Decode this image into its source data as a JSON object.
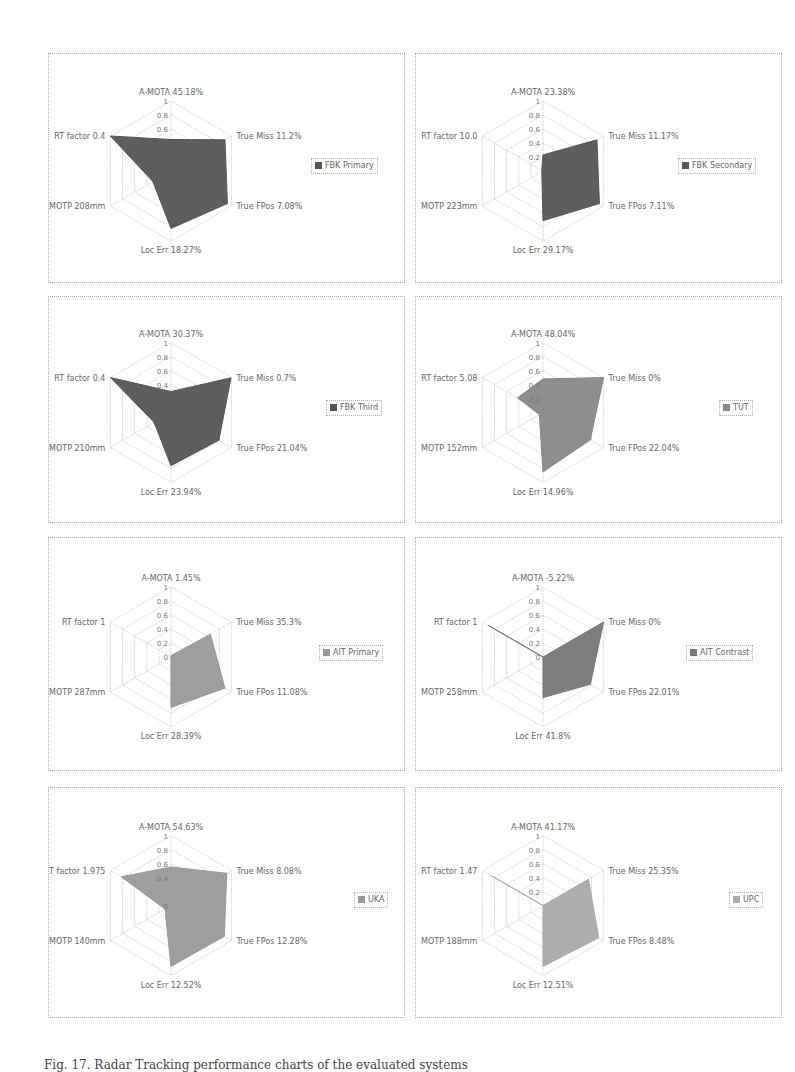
{
  "figure": {
    "caption": "Fig. 17. Radar Tracking performance charts of the evaluated systems"
  },
  "chart_data": [
    {
      "type": "radar",
      "legend": "FBK Primary",
      "color": "#555555",
      "axes": [
        "A-MOTA 45.18%",
        "True Miss 11.2%",
        "True FPos 7.08%",
        "Loc Err 18.27%",
        "MOTP 208mm",
        "RT factor 0.4"
      ],
      "ticks": [
        "1",
        "0.8",
        "0.6"
      ],
      "values": [
        0.45,
        0.89,
        0.93,
        0.82,
        0.3,
        1.0
      ],
      "rlim": [
        0,
        1
      ]
    },
    {
      "type": "radar",
      "legend": "FBK Secondary",
      "color": "#555555",
      "axes": [
        "A-MOTA 23.38%",
        "True Miss 11.17%",
        "True FPos 7.11%",
        "Loc Err 29.17%",
        "MOTP 223mm",
        "RT factor 10.0"
      ],
      "ticks": [
        "1",
        "0.8",
        "0.6",
        "0.4",
        "0.2"
      ],
      "values": [
        0.23,
        0.89,
        0.93,
        0.71,
        0.02,
        0.02
      ],
      "rlim": [
        0,
        1
      ]
    },
    {
      "type": "radar",
      "legend": "FBK Third",
      "color": "#555555",
      "axes": [
        "A-MOTA 30.37%",
        "True Miss 0.7%",
        "True FPos 21.04%",
        "Loc Err 23.94%",
        "MOTP 210mm",
        "RT factor 0.4"
      ],
      "ticks": [
        "1",
        "0.8",
        "0.6",
        "0.4"
      ],
      "values": [
        0.3,
        0.99,
        0.79,
        0.76,
        0.28,
        1.0
      ],
      "rlim": [
        0,
        1
      ]
    },
    {
      "type": "radar",
      "legend": "TUT",
      "color": "#888888",
      "axes": [
        "A-MOTA 48.04%",
        "True Miss 0%",
        "True FPos 22.04%",
        "Loc Err 14.96%",
        "MOTP 152mm",
        "RT factor 5.08"
      ],
      "ticks": [
        "1",
        "0.8",
        "0.6",
        "0.4",
        "0.2"
      ],
      "values": [
        0.48,
        1.0,
        0.78,
        0.85,
        0.06,
        0.42
      ],
      "rlim": [
        0,
        1
      ]
    },
    {
      "type": "radar",
      "legend": "AIT Primary",
      "color": "#999999",
      "axes": [
        "A-MOTA 1.45%",
        "True Miss 35.3%",
        "True FPos 11.08%",
        "Loc Err 28.39%",
        "MOTP 287mm",
        "RT factor 1"
      ],
      "ticks": [
        "1",
        "0.8",
        "0.6",
        "0.4",
        "0.2",
        "0"
      ],
      "values": [
        0.02,
        0.65,
        0.89,
        0.72,
        0.0,
        0.0
      ],
      "rlim": [
        0,
        1
      ]
    },
    {
      "type": "radar",
      "legend": "AIT Contrast",
      "color": "#777777",
      "axes": [
        "A-MOTA -5.22%",
        "True Miss 0%",
        "True FPos 22.01%",
        "Loc Err 41.8%",
        "MOTP 258mm",
        "RT factor 1"
      ],
      "ticks": [
        "1",
        "0.8",
        "0.6",
        "0.4",
        "0.2",
        "0"
      ],
      "values": [
        0.0,
        1.0,
        0.78,
        0.58,
        0.0,
        0.9
      ],
      "rlim": [
        0,
        1
      ]
    },
    {
      "type": "radar",
      "legend": "UKA",
      "color": "#999999",
      "axes": [
        "A-MOTA 54.63%",
        "True Miss 8.08%",
        "True FPos 12.28%",
        "Loc Err 12.52%",
        "MOTP 140mm",
        "RT factor 1.975"
      ],
      "ticks": [
        "1",
        "0.8",
        "0.6",
        "0.4",
        "0"
      ],
      "values": [
        0.55,
        0.92,
        0.88,
        0.87,
        0.1,
        0.82
      ],
      "rlim": [
        0,
        1
      ]
    },
    {
      "type": "radar",
      "legend": "UPC",
      "color": "#aaaaaa",
      "axes": [
        "A-MOTA 41.17%",
        "True Miss 25.35%",
        "True FPos 8.48%",
        "Loc Err 12.51%",
        "MOTP 188mm",
        "RT factor 1.47"
      ],
      "ticks": [
        "1",
        "0.8",
        "0.6",
        "0.4",
        "0.2"
      ],
      "values": [
        0.0,
        0.75,
        0.92,
        0.87,
        0.0,
        0.85
      ],
      "rlim": [
        0,
        1
      ]
    }
  ]
}
